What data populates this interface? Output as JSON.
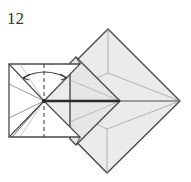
{
  "diagram": {
    "step_number": "12",
    "colors": {
      "paper_face": "#ebebeb",
      "paper_white": "#ffffff",
      "line": "#4a4a4a",
      "crease": "#9a9a9a",
      "thick_edge": "#2a2a2a"
    },
    "elements": [
      {
        "type": "diamond",
        "label": "large diamond (back layer)",
        "points": [
          [
            108,
            29
          ],
          [
            180,
            101
          ],
          [
            107,
            173
          ],
          [
            36,
            101
          ]
        ]
      },
      {
        "type": "diamond",
        "label": "middle flap",
        "points": [
          [
            78,
            54
          ],
          [
            120,
            101
          ],
          [
            78,
            148
          ]
        ]
      },
      {
        "type": "square",
        "label": "white left flap",
        "points": [
          [
            9,
            64
          ],
          [
            80,
            64
          ],
          [
            80,
            137
          ],
          [
            9,
            137
          ]
        ]
      },
      {
        "type": "valley-fold-line",
        "label": "dashed vertical fold",
        "x": 44
      },
      {
        "type": "arrow",
        "label": "fold-unfold double arrow",
        "style": "curved double-headed"
      }
    ]
  }
}
